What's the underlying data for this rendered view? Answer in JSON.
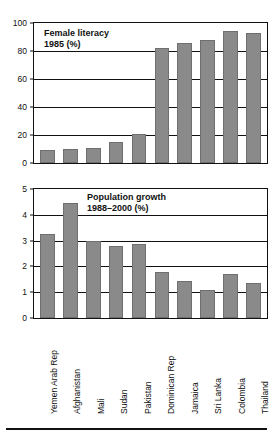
{
  "chart_data": [
    {
      "type": "bar",
      "title": "Female literacy",
      "subtitle": "1985 (%)",
      "xlabel": "",
      "ylabel": "",
      "ylim": [
        0,
        100
      ],
      "yticks": [
        0,
        20,
        40,
        60,
        80,
        100
      ],
      "grid": true,
      "legend": "none",
      "categories": [
        "Yemen Arab Rep",
        "Afghanistan",
        "Mali",
        "Sudan",
        "Pakistan",
        "Dominican Rep",
        "Jamaica",
        "Sri Lanka",
        "Colombia",
        "Thailand"
      ],
      "values": [
        9,
        10,
        11,
        15,
        21,
        82,
        86,
        88,
        94,
        93
      ]
    },
    {
      "type": "bar",
      "title": "Population growth",
      "subtitle": "1988–2000 (%)",
      "xlabel": "",
      "ylabel": "",
      "ylim": [
        0,
        5
      ],
      "yticks": [
        0,
        1,
        2,
        3,
        4,
        5
      ],
      "grid": true,
      "legend": "none",
      "categories": [
        "Yemen Arab Rep",
        "Afghanistan",
        "Mali",
        "Sudan",
        "Pakistan",
        "Dominican Rep",
        "Jamaica",
        "Sri Lanka",
        "Colombia",
        "Thailand"
      ],
      "values": [
        3.25,
        4.45,
        3.0,
        2.8,
        2.85,
        1.8,
        1.45,
        1.1,
        1.7,
        1.35
      ]
    }
  ],
  "style": {
    "bar_color": "#8a8a8a",
    "axis_color": "#111111",
    "background": "#ffffff"
  }
}
